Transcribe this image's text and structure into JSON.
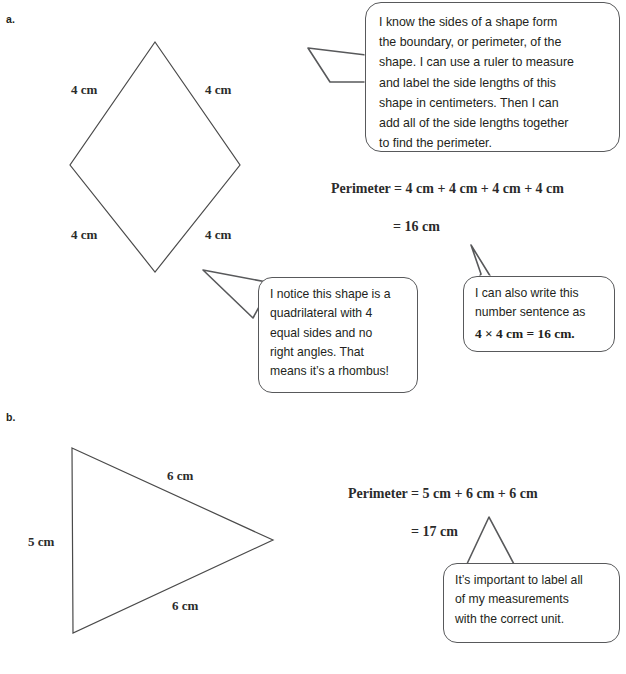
{
  "page": {
    "background_color": "#ffffff",
    "ink_color": "#231f20",
    "shape_stroke_color": "#4a4a4a",
    "bubble_stroke_color": "#58595b"
  },
  "parts": [
    {
      "label": "a.",
      "shape": {
        "name": "rhombus",
        "side_labels": [
          {
            "text": "4 cm",
            "position": "upper-left"
          },
          {
            "text": "4 cm",
            "position": "upper-right"
          },
          {
            "text": "4 cm",
            "position": "lower-left"
          },
          {
            "text": "4 cm",
            "position": "lower-right"
          }
        ]
      },
      "equation_lines": [
        "Perimeter = 4 cm + 4 cm + 4 cm + 4 cm",
        "= 16 cm"
      ],
      "bubbles": [
        {
          "name": "perimeter-explanation",
          "lines": [
            "I know the sides of a shape form",
            "the boundary, or perimeter, of the",
            "shape.  I can use a ruler to measure",
            "and label the side lengths of this",
            "shape in centimeters.  Then I can",
            "add all of the side lengths together",
            "to find the perimeter."
          ]
        },
        {
          "name": "rhombus-identification",
          "lines": [
            "I notice this shape is a",
            "quadrilateral with 4",
            "equal sides and no",
            "right angles.  That",
            "means it’s a rhombus!"
          ]
        },
        {
          "name": "multiplication-sentence",
          "lines": [
            "I can also write this",
            "number sentence as"
          ],
          "math_line": "4 × 4 cm = 16 cm."
        }
      ]
    },
    {
      "label": "b.",
      "shape": {
        "name": "triangle",
        "side_labels": [
          {
            "text": "5 cm",
            "position": "left"
          },
          {
            "text": "6 cm",
            "position": "upper-right"
          },
          {
            "text": "6 cm",
            "position": "lower-right"
          }
        ]
      },
      "equation_lines": [
        "Perimeter = 5 cm + 6 cm + 6 cm",
        "= 17 cm"
      ],
      "bubbles": [
        {
          "name": "label-units-reminder",
          "lines": [
            "It’s important to label all",
            "of my measurements",
            "with the correct unit."
          ]
        }
      ]
    }
  ]
}
